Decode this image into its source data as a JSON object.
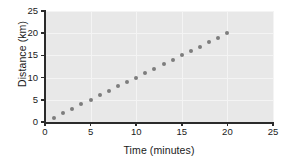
{
  "chart_data": {
    "type": "scatter",
    "title": "",
    "xlabel": "Time (minutes)",
    "ylabel": "Distance (km)",
    "xlim": [
      0,
      25
    ],
    "ylim": [
      0,
      25
    ],
    "xticks": [
      0,
      5,
      10,
      15,
      20,
      25
    ],
    "yticks": [
      0,
      5,
      10,
      15,
      20,
      25
    ],
    "grid": true,
    "legend": null,
    "series": [
      {
        "name": "distance",
        "marker": "circle",
        "color": "#7d7d7d",
        "x": [
          1,
          2,
          3,
          4,
          5,
          6,
          7,
          8,
          9,
          10,
          11,
          12,
          13,
          14,
          15,
          16,
          17,
          18,
          19,
          20
        ],
        "y": [
          1,
          2,
          3,
          4,
          5,
          6,
          7,
          8,
          9,
          10,
          11,
          12,
          13,
          14,
          15,
          16,
          17,
          18,
          19,
          20
        ]
      }
    ]
  },
  "style": {
    "plot_background": "#e8e8e8",
    "figure_background": "#ffffff",
    "gridline_color": "#f4f4f4",
    "axis_color": "#2b2b2b",
    "text_color": "#1a1a1a"
  }
}
